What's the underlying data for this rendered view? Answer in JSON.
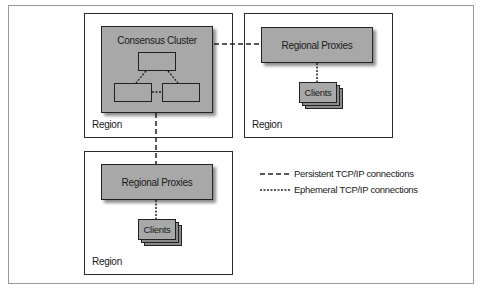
{
  "diagram": {
    "region_label": "Region",
    "consensus_cluster": {
      "label": "Consensus Cluster",
      "node_count": 3
    },
    "regions": [
      {
        "id": "region-1",
        "label": "Region",
        "contains": "Consensus Cluster"
      },
      {
        "id": "region-2",
        "label": "Region",
        "proxies_label": "Regional Proxies",
        "clients_label": "Clients"
      },
      {
        "id": "region-3",
        "label": "Region",
        "proxies_label": "Regional Proxies",
        "clients_label": "Clients"
      }
    ],
    "connections": [
      {
        "from": "Consensus Cluster",
        "to": "Regional Proxies (region-2)",
        "type": "persistent"
      },
      {
        "from": "Consensus Cluster",
        "to": "Regional Proxies (region-3)",
        "type": "persistent"
      },
      {
        "from": "Regional Proxies (region-2)",
        "to": "Clients (region-2)",
        "type": "ephemeral"
      },
      {
        "from": "Regional Proxies (region-3)",
        "to": "Clients (region-3)",
        "type": "ephemeral"
      },
      {
        "from": "cluster node",
        "to": "cluster node",
        "type": "ephemeral"
      }
    ]
  },
  "legend": {
    "persistent": {
      "label": "Persistent TCP/IP connections",
      "style": "dashed"
    },
    "ephemeral": {
      "label": "Ephemeral TCP/IP connections",
      "style": "dotted"
    }
  },
  "colors": {
    "box_fill": "#a8a8a8",
    "border": "#222222",
    "background": "#ffffff",
    "frame": "#9a9a9a"
  }
}
